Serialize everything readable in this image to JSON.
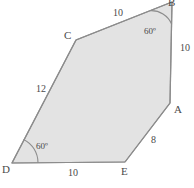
{
  "figure": {
    "kind": "geometry-polygon-diagram",
    "shape_name": "pentagon",
    "canvas": {
      "width": 194,
      "height": 188,
      "background": "#ffffff"
    },
    "style": {
      "fill": "#e3e3e3",
      "stroke": "#8c8c8c",
      "stroke_width": 1.2,
      "arc_stroke": "#8c8c8c",
      "text_color": "#4a4a4a"
    },
    "vertices": [
      {
        "id": "B",
        "label": "B",
        "x": 172,
        "y": 2,
        "label_clipped_by_top_edge": true
      },
      {
        "id": "C",
        "label": "C",
        "x": 76,
        "y": 40,
        "label_clipped_by_top_edge": false
      },
      {
        "id": "D",
        "label": "D",
        "x": 12,
        "y": 163,
        "label_clipped_by_top_edge": false
      },
      {
        "id": "E",
        "label": "E",
        "x": 125,
        "y": 162,
        "label_clipped_by_top_edge": false
      },
      {
        "id": "A",
        "label": "A",
        "x": 170,
        "y": 103,
        "label_clipped_by_top_edge": false
      }
    ],
    "sides": [
      {
        "id": "BC",
        "from": "B",
        "to": "C",
        "length_label": "10",
        "position": "top"
      },
      {
        "id": "CD",
        "from": "C",
        "to": "D",
        "length_label": "12",
        "position": "left"
      },
      {
        "id": "DE",
        "from": "D",
        "to": "E",
        "length_label": "10",
        "position": "bottom"
      },
      {
        "id": "EA",
        "from": "E",
        "to": "A",
        "length_label": "8",
        "position": "lower-right"
      },
      {
        "id": "AB",
        "from": "A",
        "to": "B",
        "length_label": "10",
        "position": "right"
      }
    ],
    "angles": [
      {
        "id": "angle-B",
        "at": "B",
        "label": "60º",
        "arc_radius": 22
      },
      {
        "id": "angle-D",
        "at": "D",
        "label": "60º",
        "arc_radius": 26
      }
    ],
    "polygon_points": "172,2 76,40 12,163 125,162 170,103"
  }
}
